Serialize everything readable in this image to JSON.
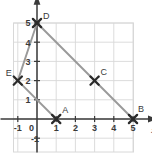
{
  "figure": {
    "kind": "coordinate-grid-plot",
    "background_color": "#ffffff",
    "grid_color": "#d8d8d8",
    "axis_color": "#3a3a3a",
    "segment_color": "#9a9a9a",
    "marker_color": "#2b2b2b",
    "label_color": "#3a3a3a"
  },
  "axes": {
    "x_name": "x",
    "y_name": "y",
    "x_tick_labels": [
      "-1",
      "0",
      "1",
      "2",
      "3",
      "4",
      "5"
    ],
    "y_tick_labels": [
      "-1",
      "1",
      "2",
      "3",
      "4",
      "5"
    ],
    "origin_label": "0",
    "x_range": [
      -1.8,
      6.3
    ],
    "y_range": [
      -2.0,
      6.2
    ],
    "grid_on": true,
    "x_arrow": true,
    "y_arrow": true
  },
  "chart_data": {
    "type": "scatter",
    "title": "",
    "xlabel": "x",
    "ylabel": "y",
    "xlim": [
      -1.8,
      6.3
    ],
    "ylim": [
      -2.0,
      6.2
    ],
    "grid": true,
    "points": [
      {
        "name": "A",
        "x": 1,
        "y": 0,
        "marker": "x",
        "label_dx": 6,
        "label_dy": -6
      },
      {
        "name": "B",
        "x": 5,
        "y": 0,
        "marker": "x",
        "label_dx": 5,
        "label_dy": -7
      },
      {
        "name": "C",
        "x": 3,
        "y": 2,
        "marker": "x",
        "label_dx": 6,
        "label_dy": -6
      },
      {
        "name": "D",
        "x": 0,
        "y": 5,
        "marker": "x",
        "label_dx": 6,
        "label_dy": -4
      },
      {
        "name": "E",
        "x": -1,
        "y": 2,
        "marker": "x",
        "label_dx": -12,
        "label_dy": -5
      }
    ],
    "segments": [
      {
        "from": "D",
        "to": "B",
        "passes_through": "C"
      },
      {
        "from": "D",
        "to": "E"
      },
      {
        "from": "E",
        "to": "A"
      }
    ]
  }
}
